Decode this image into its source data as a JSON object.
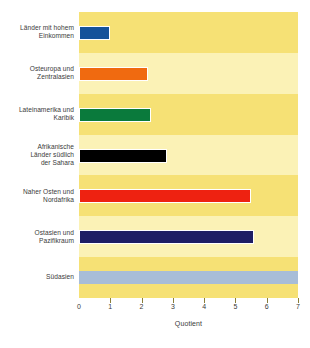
{
  "chart_data": {
    "type": "bar",
    "orientation": "horizontal",
    "title": "",
    "xlabel": "Quotient",
    "ylabel": "",
    "xlim": [
      0,
      7
    ],
    "xticks": [
      0,
      1,
      2,
      3,
      4,
      5,
      6,
      7
    ],
    "xticklabels": [
      "0",
      "1",
      "2",
      "3",
      "4",
      "5",
      "6",
      "7"
    ],
    "grid": false,
    "legend": "none",
    "categories": [
      "Länder mit hohem\nEinkommen",
      "Osteuropa und\nZentralasien",
      "Lateinamerika und\nKaribik",
      "Afrikanische\nLänder südlich\nder Sahara",
      "Naher Osten und\nNordafrika",
      "Ostasien und\nPazifikraum",
      "Südasien"
    ],
    "values": [
      1.0,
      2.2,
      2.3,
      2.8,
      5.5,
      5.6,
      7.0
    ],
    "bar_colors": [
      "#15529A",
      "#F06A10",
      "#0A7A3C",
      "#000000",
      "#EE2211",
      "#1E1E64",
      "#A8BDD8"
    ],
    "background_bands": [
      "#F6E175",
      "#FBF2B6"
    ],
    "plot_background": "#FAF0B0"
  }
}
